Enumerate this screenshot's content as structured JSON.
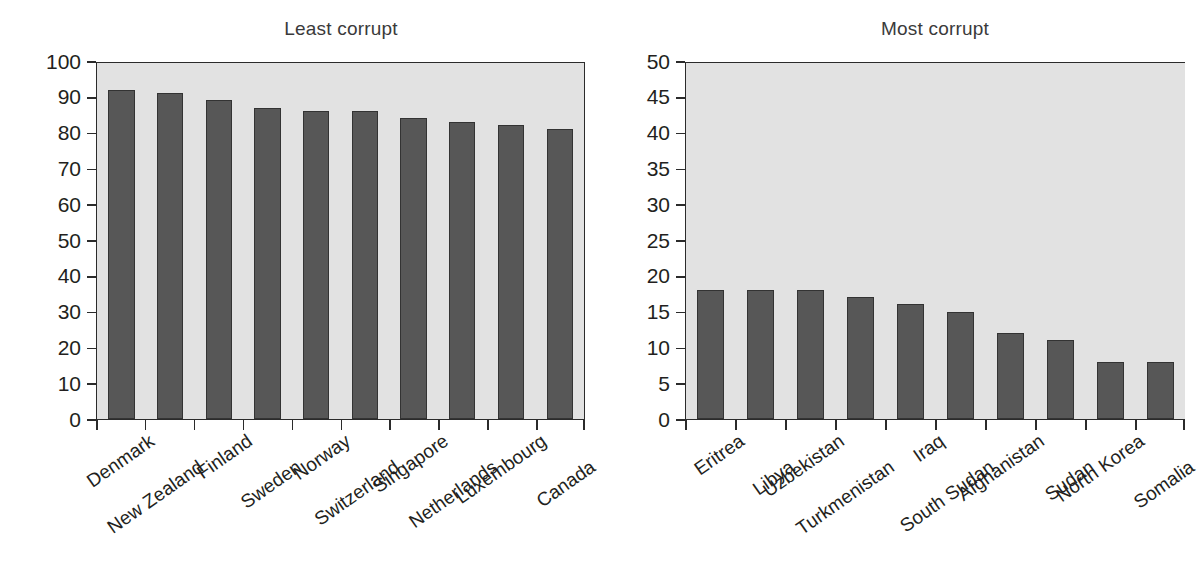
{
  "chart_data": [
    {
      "type": "bar",
      "title": "Least corrupt",
      "xlabel": "",
      "ylabel": "",
      "ylim": [
        0,
        100
      ],
      "ytick_step": 10,
      "yticks": [
        100,
        90,
        80,
        70,
        60,
        50,
        40,
        30,
        20,
        10,
        0
      ],
      "categories": [
        "Denmark",
        "New Zealand",
        "Finland",
        "Sweden",
        "Norway",
        "Switzerland",
        "Singapore",
        "Netherlands",
        "Luxembourg",
        "Canada"
      ],
      "values": [
        92,
        91,
        89,
        87,
        86,
        86,
        84,
        83,
        82,
        81
      ],
      "grid": false,
      "legend": "none",
      "bar_color": "#575757",
      "bar_edge_color": "#333333",
      "plot_background": "#e2e2e2"
    },
    {
      "type": "bar",
      "title": "Most corrupt",
      "xlabel": "",
      "ylabel": "",
      "ylim": [
        0,
        50
      ],
      "ytick_step": 5,
      "yticks": [
        50,
        45,
        40,
        35,
        30,
        25,
        20,
        15,
        10,
        5,
        0
      ],
      "categories": [
        "Eritrea",
        "Libya",
        "Uzbekistan",
        "Turkmenistan",
        "Iraq",
        "South Sudan",
        "Afghanistan",
        "Sudan",
        "North Korea",
        "Somalia"
      ],
      "values": [
        18,
        18,
        18,
        17,
        16,
        15,
        12,
        11,
        8,
        8
      ],
      "grid": false,
      "legend": "none",
      "bar_color": "#575757",
      "bar_edge_color": "#333333",
      "plot_background": "#e2e2e2"
    }
  ]
}
